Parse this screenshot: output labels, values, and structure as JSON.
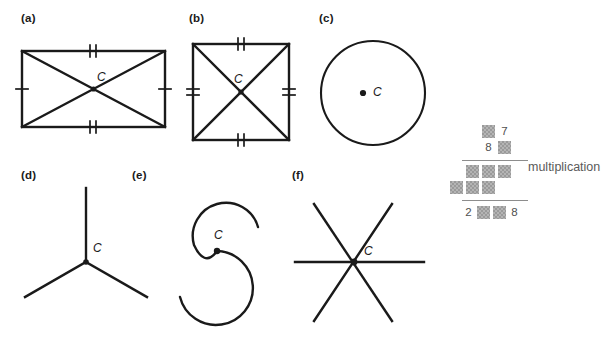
{
  "figure": {
    "background_color": "#ffffff",
    "line_color": "#1a1a1a",
    "panels": [
      {
        "id": "a",
        "label": "(a)",
        "shape": "rectangle-with-diagonals",
        "center_label": "C",
        "description": "Rectangle with both diagonals drawn meeting at center C",
        "tick_marks": {
          "left": 1,
          "right": 1,
          "top": 2,
          "bottom": 2
        }
      },
      {
        "id": "b",
        "label": "(b)",
        "shape": "square-with-diagonals",
        "center_label": "C",
        "description": "Square with both diagonals drawn meeting at center C",
        "tick_marks": {
          "left": 2,
          "right": 2,
          "top": 2,
          "bottom": 2
        }
      },
      {
        "id": "c",
        "label": "(c)",
        "shape": "circle",
        "center_label": "C",
        "description": "Circle with marked center point C",
        "tick_marks": {
          "left": 0,
          "right": 0,
          "top": 0,
          "bottom": 0
        }
      },
      {
        "id": "d",
        "label": "(d)",
        "shape": "three-ray-star",
        "center_label": "C",
        "description": "Y shape of three rays meeting at point C",
        "ray_count": 3
      },
      {
        "id": "e",
        "label": "(e)",
        "shape": "s-curve",
        "center_label": "C",
        "description": "S shaped curve with marked point C at its middle",
        "ray_count": 0
      },
      {
        "id": "f",
        "label": "(f)",
        "shape": "six-ray-asterisk",
        "center_label": "C",
        "description": "Three straight lines crossing at point C forming six rays",
        "ray_count": 6
      }
    ]
  },
  "multiplication": {
    "caption": "multiplication",
    "box_color": "#9a9a9a",
    "rule_color": "#8d8d8d",
    "rows": [
      {
        "name": "multiplicand",
        "cells": [
          {
            "text": "",
            "hidden": true
          },
          {
            "text": "7",
            "hidden": false
          }
        ]
      },
      {
        "name": "multiplier",
        "cells": [
          {
            "text": "8",
            "hidden": false
          },
          {
            "text": "",
            "hidden": true
          }
        ]
      },
      {
        "name": "partial-product-1",
        "cells": [
          {
            "text": "",
            "hidden": true
          },
          {
            "text": "",
            "hidden": true
          },
          {
            "text": "",
            "hidden": true
          }
        ]
      },
      {
        "name": "partial-product-2",
        "cells": [
          {
            "text": "",
            "hidden": true
          },
          {
            "text": "",
            "hidden": true
          },
          {
            "text": "",
            "hidden": true
          }
        ]
      },
      {
        "name": "product",
        "cells": [
          {
            "text": "2",
            "hidden": false
          },
          {
            "text": "",
            "hidden": true
          },
          {
            "text": "",
            "hidden": true
          },
          {
            "text": "8",
            "hidden": false
          }
        ]
      }
    ]
  }
}
